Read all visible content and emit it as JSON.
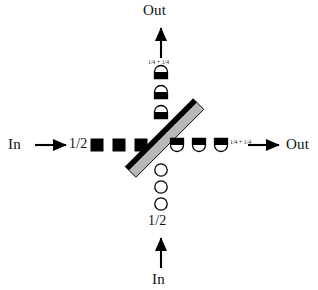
{
  "figure": {
    "background_color": "#ffffff",
    "ink_color": "#000000",
    "splitter_face_color": "#b8b8b8",
    "splitter_edge_color": "#000000"
  },
  "ports": {
    "left_input_label": "In",
    "bottom_input_label": "In",
    "top_output_label": "Out",
    "right_output_label": "Out"
  },
  "amplitude_labels": {
    "left_input": "1/2",
    "bottom_input": "1/2",
    "top_output": "1/4 + 1/4",
    "right_output": "1/4 + 1/4"
  },
  "beams": {
    "left_input_tokens": {
      "symbol_kind": "filled-square",
      "count": 3,
      "fill": "#000000",
      "x_positions": [
        97,
        119,
        141
      ],
      "y": 145
    },
    "right_output_tokens": {
      "symbol_kind": "top-half-filled-dome",
      "count": 3,
      "fill": "#000000",
      "x_positions": [
        177,
        199,
        221
      ],
      "y": 145
    },
    "top_output_tokens": {
      "symbol_kind": "bottom-half-filled-dome",
      "count": 3,
      "fill": "#000000",
      "x": 161,
      "y_positions": [
        72,
        92,
        112
      ]
    },
    "bottom_input_tokens": {
      "symbol_kind": "open-circle",
      "count": 3,
      "fill": "#ffffff",
      "stroke": "#000000",
      "x": 161,
      "y_positions": [
        170,
        187,
        204
      ]
    }
  },
  "beam_splitter": {
    "name": "beam-splitter",
    "orientation_degrees": 45,
    "from": [
      133,
      172
    ],
    "to": [
      196,
      104
    ],
    "face_color": "#b8b8b8",
    "edge_color": "#000000"
  },
  "arrows": {
    "left_input_arrow": {
      "from": [
        35,
        145
      ],
      "to": [
        70,
        145
      ],
      "direction": "right"
    },
    "right_output_arrow": {
      "from": [
        248,
        145
      ],
      "to": [
        283,
        145
      ],
      "direction": "right"
    },
    "top_output_arrow": {
      "from": [
        161,
        58
      ],
      "to": [
        161,
        24
      ],
      "direction": "up"
    },
    "bottom_input_arrow": {
      "from": [
        161,
        268
      ],
      "to": [
        161,
        234
      ],
      "direction": "up"
    }
  }
}
